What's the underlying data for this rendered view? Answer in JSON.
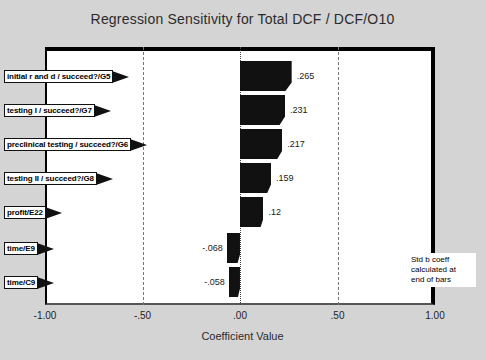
{
  "chart_data": {
    "type": "bar",
    "orientation": "horizontal",
    "title": "Regression Sensitivity for Total DCF / DCF/O10",
    "xlabel": "Coefficient Value",
    "ylabel": "",
    "xlim": [
      -1.0,
      1.0
    ],
    "xticks": [
      "-1.00",
      "-.50",
      ".00",
      ".50",
      "1.00"
    ],
    "xtick_values": [
      -1.0,
      -0.5,
      0.0,
      0.5,
      1.0
    ],
    "gridlines": [
      -0.5,
      0.5
    ],
    "grid": true,
    "legend": "none",
    "annotation": "Std b coeff\ncalculated at\nend of bars",
    "bar_color": "#111111",
    "categories": [
      "initial r and d / succeed?/G5",
      "testing I / succeed?/G7",
      "preclinical testing / succeed?/G6",
      "testing II / succeed?/G8",
      "profit/E22",
      "time/E9",
      "time/C9"
    ],
    "values": [
      0.265,
      0.231,
      0.217,
      0.159,
      0.12,
      -0.068,
      -0.058
    ],
    "value_labels": [
      ".265",
      ".231",
      ".217",
      ".159",
      ".12",
      "-.068",
      "-.058"
    ]
  }
}
